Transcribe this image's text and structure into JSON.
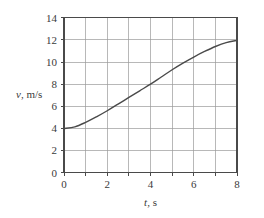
{
  "chart_data": {
    "type": "line",
    "title": "",
    "xlabel": "t, s",
    "ylabel": "v, m/s",
    "xlabel_var": "t",
    "xlabel_unit": ", s",
    "ylabel_var": "v",
    "ylabel_unit": ", m/s",
    "xlim": [
      0,
      8
    ],
    "ylim": [
      0,
      14
    ],
    "grid": true,
    "legend": "none",
    "x_major_ticks": [
      0,
      2,
      4,
      6,
      8
    ],
    "x_minor_ticks": [
      1,
      3,
      5,
      7
    ],
    "x_tick_labels": [
      "0",
      "2",
      "4",
      "6",
      "8"
    ],
    "y_major_ticks": [
      0,
      2,
      4,
      6,
      8,
      10,
      12,
      14
    ],
    "y_tick_labels": [
      "0",
      "2",
      "4",
      "6",
      "8",
      "10",
      "12",
      "14"
    ],
    "series": [
      {
        "name": "velocity",
        "color": "#4a4a4a",
        "x": [
          0.0,
          0.5,
          1.0,
          1.5,
          2.0,
          2.5,
          3.0,
          3.5,
          4.0,
          4.5,
          5.0,
          5.5,
          6.0,
          6.5,
          7.0,
          7.5,
          8.0
        ],
        "values": [
          4.0,
          4.15,
          4.55,
          5.05,
          5.6,
          6.2,
          6.8,
          7.4,
          8.0,
          8.65,
          9.3,
          9.9,
          10.45,
          10.95,
          11.4,
          11.75,
          11.95
        ]
      }
    ],
    "annotations": []
  }
}
